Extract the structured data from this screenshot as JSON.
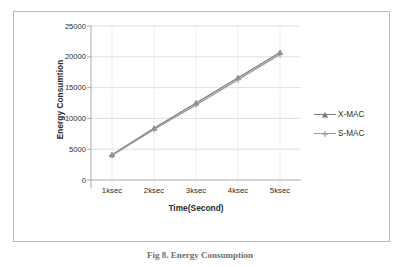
{
  "figure": {
    "caption": "Fig 8. Energy Consumption"
  },
  "chart_data": {
    "type": "line",
    "title": "",
    "xlabel": "Time(Second)",
    "ylabel": "Energy Consumtion",
    "categories": [
      "1ksec",
      "2ksec",
      "3ksec",
      "4ksec",
      "5ksec"
    ],
    "ytick_labels": [
      "0",
      "5000",
      "10000",
      "15000",
      "20000",
      "25000"
    ],
    "yticks": [
      0,
      5000,
      10000,
      15000,
      20000,
      25000
    ],
    "ylim": [
      0,
      25000
    ],
    "grid": true,
    "grid_x": "dotted",
    "grid_y": "solid",
    "legend_position": "right",
    "series": [
      {
        "name": "X-MAC",
        "marker": "triangle",
        "color": "#7b7b7b",
        "values": [
          4100,
          8400,
          12500,
          16600,
          20700
        ]
      },
      {
        "name": "S-MAC",
        "marker": "cross",
        "color": "#9a9a9a",
        "values": [
          4000,
          8200,
          12200,
          16300,
          20400
        ]
      }
    ]
  },
  "colors": {
    "frame_border": "#b9b9b9",
    "axis": "#9f9f9f",
    "gridline": "#d8d8d8",
    "series_x_mac": "#7b7b7b",
    "series_s_mac": "#9a9a9a",
    "text": "#2b2b2b"
  }
}
